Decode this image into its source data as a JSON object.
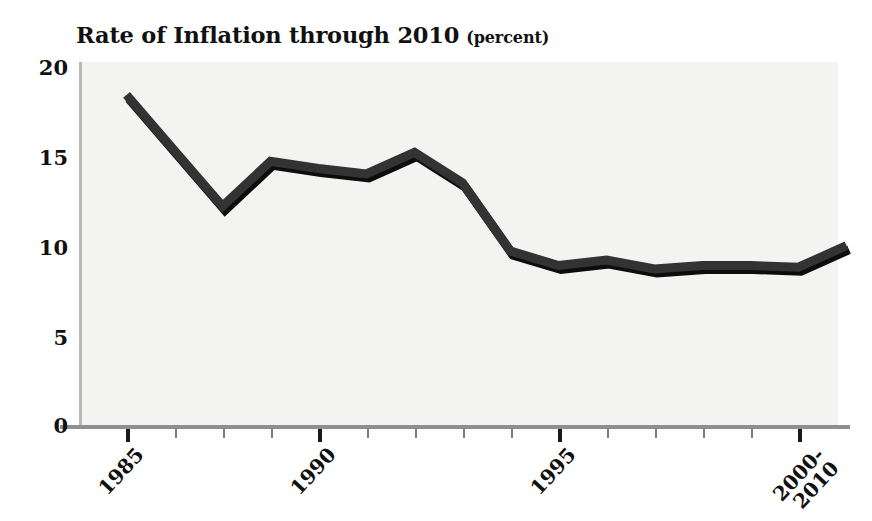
{
  "title": {
    "main": "Rate of Inflation through 2010",
    "sub": "(percent)"
  },
  "axes": {
    "y_ticks": [
      "20",
      "15",
      "10",
      "5",
      "0"
    ],
    "x_major_labels": [
      "1985",
      "1990",
      "1995",
      "2000-\n2010"
    ]
  },
  "colors": {
    "line": "#333333",
    "line_shadow": "#0d0d0d",
    "plot_background": "#f3f3f1",
    "axis": "#8f8f8f",
    "text": "#111111"
  },
  "chart_data": {
    "type": "line",
    "xlabel": "",
    "ylabel": "percent",
    "ylim": [
      0,
      20
    ],
    "yticks": [
      0,
      5,
      10,
      15,
      20
    ],
    "xlim": [
      "1985",
      "2000-2010"
    ],
    "xticks": [
      "1985",
      "1990",
      "1995",
      "2000-2010"
    ],
    "grid": false,
    "legend": "none",
    "x": [
      "1985",
      "1986",
      "1987",
      "1988",
      "1989",
      "1990",
      "1991",
      "1992",
      "1993",
      "1994",
      "1995",
      "1996",
      "1997",
      "1998",
      "1999",
      "2000-2010"
    ],
    "values": [
      18.5,
      15.4,
      12.3,
      14.8,
      14.4,
      14.1,
      15.3,
      13.6,
      9.8,
      9.0,
      9.3,
      8.8,
      9.0,
      9.0,
      8.9,
      10.1
    ],
    "series": [
      {
        "name": "Rate of Inflation",
        "values": [
          18.5,
          15.4,
          12.3,
          14.8,
          14.4,
          14.1,
          15.3,
          13.6,
          9.8,
          9.0,
          9.3,
          8.8,
          9.0,
          9.0,
          8.9,
          10.1
        ]
      }
    ]
  }
}
